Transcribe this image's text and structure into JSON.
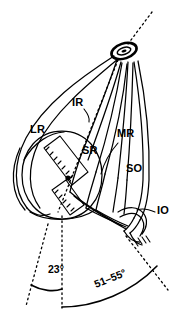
{
  "figure": {
    "type": "anatomical-line-diagram",
    "ink_color": "#000000",
    "background_color": "#ffffff"
  },
  "muscle_labels": [
    {
      "id": "LR",
      "text": "LR",
      "name": "lateral-rectus",
      "x": 30,
      "y": 133
    },
    {
      "id": "IR",
      "text": "IR",
      "name": "inferior-rectus",
      "x": 72,
      "y": 106
    },
    {
      "id": "SR",
      "text": "SR",
      "name": "superior-rectus",
      "x": 82,
      "y": 154
    },
    {
      "id": "MR",
      "text": "MR",
      "name": "medial-rectus",
      "x": 117,
      "y": 137
    },
    {
      "id": "SO",
      "text": "SO",
      "name": "superior-oblique",
      "x": 126,
      "y": 172
    },
    {
      "id": "IO",
      "text": "IO",
      "name": "inferior-oblique",
      "x": 157,
      "y": 214
    }
  ],
  "angle_annotations": [
    {
      "id": "A23",
      "text": "23°",
      "name": "angle-23-degrees",
      "x": 48,
      "y": 273,
      "rotation": 0
    },
    {
      "id": "A5155",
      "text": "51–55°",
      "name": "angle-51-55-degrees",
      "x": 96,
      "y": 288,
      "rotation": -22
    }
  ],
  "apex": {
    "name": "annulus-of-zinn",
    "cx": 124,
    "cy": 51
  },
  "globe": {
    "name": "globe-eyeball",
    "cx": 62,
    "cy": 175,
    "rx": 40,
    "ry": 44
  }
}
